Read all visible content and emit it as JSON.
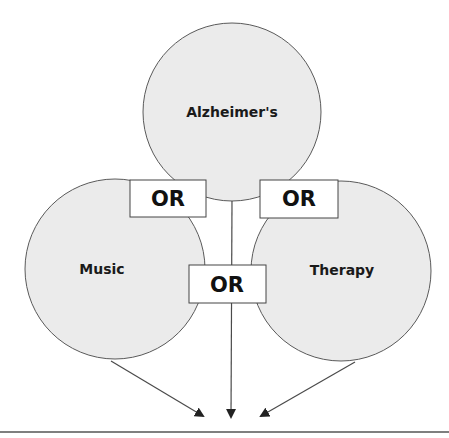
{
  "diagram": {
    "type": "venn-boolean-search",
    "colors": {
      "circle_fill": "#ebebeb",
      "circle_stroke": "#5a5a5a",
      "box_fill": "#ffffff",
      "text": "#111111"
    },
    "circles": [
      {
        "id": "top",
        "label": "Alzheimer's",
        "cx": 232,
        "cy": 112,
        "r": 89
      },
      {
        "id": "left",
        "label": "Music",
        "cx": 115,
        "cy": 269,
        "r": 90
      },
      {
        "id": "right",
        "label": "Therapy",
        "cx": 341,
        "cy": 271,
        "r": 90
      }
    ],
    "operators": [
      {
        "id": "or-top-left",
        "label": "OR",
        "x": 130,
        "y": 180,
        "w": 76,
        "h": 37
      },
      {
        "id": "or-top-right",
        "label": "OR",
        "x": 260,
        "y": 180,
        "w": 78,
        "h": 38
      },
      {
        "id": "or-bottom",
        "label": "OR",
        "x": 189,
        "y": 265,
        "w": 77,
        "h": 38
      }
    ],
    "arrows": [
      {
        "from": "left",
        "x1": 111,
        "y1": 361,
        "x2": 203,
        "y2": 416
      },
      {
        "from": "top",
        "x1": 232,
        "y1": 201,
        "x2": 231,
        "y2": 418
      },
      {
        "from": "right",
        "x1": 355,
        "y1": 362,
        "x2": 261,
        "y2": 416
      }
    ]
  }
}
